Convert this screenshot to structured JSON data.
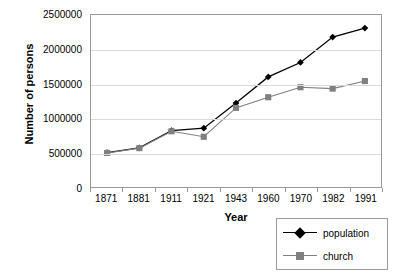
{
  "chart_data": {
    "type": "line",
    "title": "",
    "xlabel": "Year",
    "ylabel": "Number of persons",
    "categories": [
      "1871",
      "1881",
      "1911",
      "1921",
      "1943",
      "1960",
      "1970",
      "1982",
      "1991"
    ],
    "ylim": [
      0,
      2500000
    ],
    "yticks": [
      0,
      500000,
      1000000,
      1500000,
      2000000,
      2500000
    ],
    "ytick_labels": [
      "0",
      "500000",
      "1000000",
      "1500000",
      "2000000",
      "2500000"
    ],
    "grid": true,
    "legend_position": "bottom-right",
    "series": [
      {
        "name": "population",
        "color": "#000000",
        "marker": "diamond",
        "values": [
          500000,
          570000,
          820000,
          855000,
          1220000,
          1600000,
          1810000,
          2180000,
          2310000
        ]
      },
      {
        "name": "church",
        "color": "#808080",
        "marker": "square",
        "values": [
          495000,
          565000,
          810000,
          730000,
          1150000,
          1305000,
          1450000,
          1430000,
          1540000
        ]
      }
    ]
  },
  "axes": {
    "y_title": "Number of persons",
    "x_title": "Year"
  },
  "legend": {
    "entries": [
      {
        "label": "population"
      },
      {
        "label": "church"
      }
    ]
  },
  "colors": {
    "population": "#000000",
    "church": "#808080",
    "gridline": "#d9d9d9",
    "frame": "#9a9a9a",
    "background": "#ffffff"
  }
}
